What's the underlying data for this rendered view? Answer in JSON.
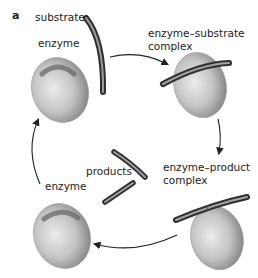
{
  "figure": {
    "panel_label": "a",
    "labels": {
      "substrate": "substrate",
      "enzyme_top": "enzyme",
      "es_complex_line1": "enzyme–substrate",
      "es_complex_line2": "complex",
      "ep_complex_line1": "enzyme–product",
      "ep_complex_line2": "complex",
      "products": "products",
      "enzyme_bottom": "enzyme"
    },
    "colors": {
      "enzyme_light": "#e4e4e4",
      "enzyme_dark": "#8a8a8a",
      "rod_dark": "#3a3a3a",
      "rod_light": "#b5b5b5",
      "arrow": "#222222"
    }
  }
}
